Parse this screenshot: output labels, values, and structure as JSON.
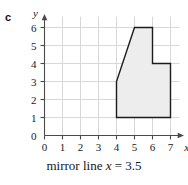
{
  "figure": {
    "part_label": "c",
    "caption_prefix": "mirror line ",
    "caption_var": "x",
    "caption_suffix": " = 3.5",
    "caption_full": "mirror line x = 3.5"
  },
  "chart_data": {
    "type": "scatter",
    "title": "",
    "subtitle": "",
    "xlabel": "x",
    "ylabel": "y",
    "xlim": [
      0,
      7.6
    ],
    "ylim": [
      0,
      6.6
    ],
    "xticks": [
      0,
      1,
      2,
      3,
      4,
      5,
      6,
      7
    ],
    "yticks": [
      0,
      1,
      2,
      3,
      4,
      5,
      6
    ],
    "xtick_labels": [
      "0",
      "1",
      "2",
      "3",
      "4",
      "5",
      "6",
      "7"
    ],
    "ytick_labels": [
      "0",
      "1",
      "2",
      "3",
      "4",
      "5",
      "6"
    ],
    "grid": true,
    "grid_color": "#d8d8d8",
    "axis_color": "#4a4a4a",
    "legend": null,
    "annotations": [
      {
        "text": "mirror line x = 3.5",
        "position": "below-axes"
      }
    ],
    "shapes": [
      {
        "name": "shaded-polygon",
        "kind": "polygon",
        "closed": true,
        "fill": "#ededed",
        "stroke": "#1c1c1c",
        "stroke_width": 1.4,
        "vertices": [
          [
            4,
            1
          ],
          [
            4,
            3
          ],
          [
            5,
            6
          ],
          [
            6,
            6
          ],
          [
            6,
            4
          ],
          [
            7,
            4
          ],
          [
            7,
            1
          ]
        ]
      }
    ],
    "mirror_line": {
      "axis": "x",
      "value": 3.5,
      "drawn": false
    }
  }
}
